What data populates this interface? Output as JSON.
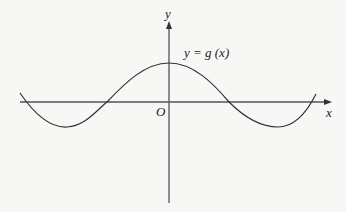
{
  "diagram": {
    "axes": {
      "x_label": "x",
      "y_label": "y",
      "origin_label": "O"
    },
    "curve": {
      "label": "y = g (x)",
      "shape": "cosine-like wave, maximum on y-axis, two zeros on either side, minima near the ends"
    },
    "colors": {
      "axis": "#555555",
      "curve": "#333333",
      "background": "#f7f7f5"
    }
  }
}
